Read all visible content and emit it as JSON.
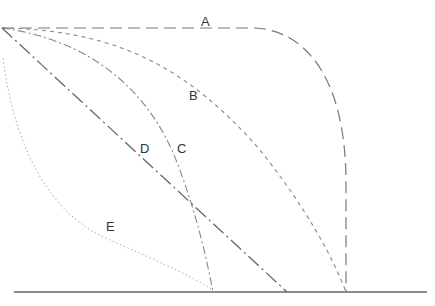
{
  "diagram": {
    "type": "line-curves",
    "colors": {
      "background": "#ffffff",
      "axis": "#666666",
      "curve": "#777777",
      "label": "#333333"
    },
    "labels": {
      "A": "A",
      "B": "B",
      "C": "C",
      "D": "D",
      "E": "E"
    },
    "curves": [
      {
        "id": "A",
        "style": "long-dash",
        "description": "flat top then rounds down to vertical at right"
      },
      {
        "id": "B",
        "style": "short-dash",
        "description": "convex curve from top-left to vertical foot"
      },
      {
        "id": "C",
        "style": "dash-dot",
        "description": "convex curve from top-left ending near middle of baseline"
      },
      {
        "id": "D",
        "style": "long-dash-dot",
        "description": "straight diagonal line"
      },
      {
        "id": "E",
        "style": "dotted",
        "description": "concave curve from left edge to baseline"
      }
    ],
    "baseline": {
      "description": "horizontal base line"
    }
  }
}
